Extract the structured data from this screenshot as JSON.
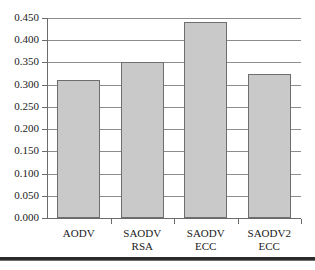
{
  "chart_data": {
    "type": "bar",
    "title": "",
    "xlabel": "",
    "ylabel": "",
    "categories": [
      "AODV",
      "SAODV\nRSA",
      "SAODV\nECC",
      "SAODV2\nECC"
    ],
    "values": [
      0.31,
      0.35,
      0.441,
      0.324
    ],
    "ylim": [
      0.0,
      0.45
    ],
    "ytick_labels": [
      "0.450",
      "0.400",
      "0.350",
      "0.300",
      "0.250",
      "0.200",
      "0.150",
      "0.100",
      "0.050",
      "0.000"
    ],
    "ytick_values": [
      0.45,
      0.4,
      0.35,
      0.3,
      0.25,
      0.2,
      0.15,
      0.1,
      0.05,
      0.0
    ],
    "grid": true,
    "legend": false,
    "series": [
      {
        "name": "",
        "values": [
          0.31,
          0.35,
          0.441,
          0.324
        ]
      }
    ],
    "colors": {
      "bar_fill": "#c9c9c9",
      "bar_edge": "#6e6e6e",
      "gridline": "#8c8c8c",
      "axis": "#6b6b6b",
      "text": "#1a1a1a",
      "background": "#ffffff",
      "bottom_rule": "#2b2b2b"
    }
  }
}
